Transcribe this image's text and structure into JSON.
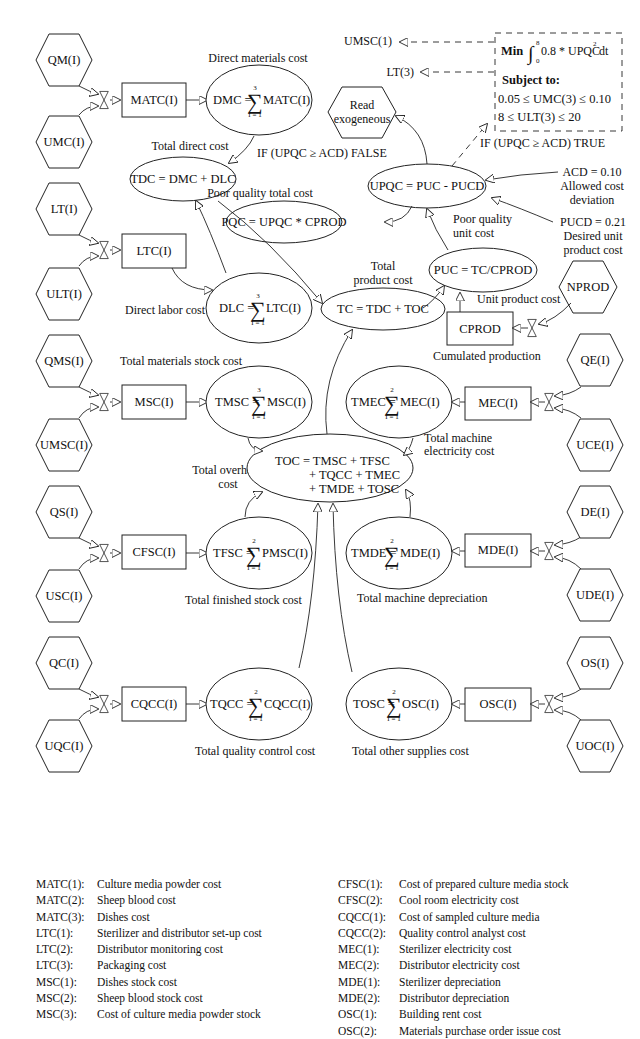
{
  "diagram": {
    "exogenous_left": [
      "QM(I)",
      "UMC(I)",
      "LT(I)",
      "ULT(I)",
      "QMS(I)",
      "UMSC(I)",
      "QS(I)",
      "USC(I)",
      "QC(I)",
      "UQC(I)"
    ],
    "exogenous_right": [
      "NPROD",
      "QE(I)",
      "UCE(I)",
      "DE(I)",
      "UDE(I)",
      "OS(I)",
      "UOC(I)"
    ],
    "read_exogeneous": [
      "Read",
      "exogeneous"
    ],
    "stocks": {
      "matc": "MATC(I)",
      "ltc": "LTC(I)",
      "msc": "MSC(I)",
      "cfsc": "CFSC(I)",
      "cqcc": "CQCC(I)",
      "cprod": "CPROD",
      "mec": "MEC(I)",
      "mde": "MDE(I)",
      "osc": "OSC(I)"
    },
    "sums": {
      "dmc": {
        "lhs": "DMC =",
        "rhs": "MATC(I)",
        "upper": "3",
        "lower": "I = 1",
        "caption": "Direct materials cost"
      },
      "dlc": {
        "lhs": "DLC =",
        "rhs": "LTC(I)",
        "upper": "3",
        "lower": "I = 1",
        "caption": "Direct labor cost"
      },
      "tmsc": {
        "lhs": "TMSC =",
        "rhs": "MSC(I)",
        "upper": "3",
        "lower": "I = 1",
        "caption": "Total materials stock cost"
      },
      "tfsc": {
        "lhs": "TFSC =",
        "rhs": "PMSC(I)",
        "upper": "2",
        "lower": "I = 1",
        "caption": "Total finished stock cost"
      },
      "tqcc": {
        "lhs": "TQCC =",
        "rhs": "CQCC(I)",
        "upper": "2",
        "lower": "I = 1",
        "caption": "Total quality control cost"
      },
      "tmec": {
        "lhs": "TMEC =",
        "rhs": "MEC(I)",
        "upper": "2",
        "lower": "I = 1",
        "caption": [
          "Total machine",
          "electricity cost"
        ]
      },
      "tmde": {
        "lhs": "TMDE =",
        "rhs": "MDE(I)",
        "upper": "2",
        "lower": "I = 1",
        "caption": "Total machine depreciation"
      },
      "tosc": {
        "lhs": "TOSC =",
        "rhs": "OSC(I)",
        "upper": "2",
        "lower": "I = 1",
        "caption": "Total other supplies cost"
      }
    },
    "equations": {
      "tdc": {
        "text": "TDC = DMC + DLC",
        "caption": "Total direct cost"
      },
      "tc": {
        "text": "TC = TDC + TOC",
        "caption": [
          "Total",
          "product cost"
        ]
      },
      "puc": {
        "text": "PUC = TC/CPROD",
        "caption": "Unit product cost"
      },
      "upqc": {
        "text": "UPQC = PUC - PUCD",
        "caption": [
          "Poor quality",
          "unit cost"
        ]
      },
      "pqc": {
        "text": "PQC = UPQC * CPROD",
        "caption": "Poor quality total cost"
      },
      "toc": {
        "lines": [
          "TOC = TMSC + TFSC",
          "+ TQCC + TMEC",
          "+ TMDE + TOSC"
        ],
        "caption": [
          "Total overhead",
          "cost"
        ]
      }
    },
    "cprod_caption": "Cumulated production",
    "constants": {
      "acd": [
        "ACD = 0.10",
        "Allowed cost",
        "deviation"
      ],
      "pucd": [
        "PUCD = 0.21",
        "Desired unit",
        "product cost"
      ]
    },
    "conditions": {
      "false_branch": "IF (UPQC ≥ ACD) FALSE",
      "true_branch": "IF (UPQC ≥ ACD) TRUE"
    },
    "optimization": {
      "objective_min": "Min",
      "integral_upper": "8",
      "integral_lower": "0",
      "objective_expr": "0.8 * UPQC",
      "objective_exp": "2",
      "objective_dt": "dt",
      "subject_to": "Subject to:",
      "constraints": [
        "0.05 ≤ UMC(3) ≤ 0.10",
        "8 ≤ ULT(3) ≤ 20"
      ],
      "outputs": [
        "UMSC(1)",
        "LT(3)"
      ]
    },
    "sigma": "∑"
  },
  "legend": {
    "left": [
      {
        "key": "MATC(1):",
        "desc": "Culture media powder cost"
      },
      {
        "key": "MATC(2):",
        "desc": "Sheep blood cost"
      },
      {
        "key": "MATC(3):",
        "desc": "Dishes cost"
      },
      {
        "key": "LTC(1):",
        "desc": "Sterilizer and distributor set-up cost"
      },
      {
        "key": "LTC(2):",
        "desc": "Distributor monitoring cost"
      },
      {
        "key": "LTC(3):",
        "desc": "Packaging cost"
      },
      {
        "key": "MSC(1):",
        "desc": "Dishes stock cost"
      },
      {
        "key": "MSC(2):",
        "desc": "Sheep blood stock cost"
      },
      {
        "key": "MSC(3):",
        "desc": "Cost of culture media powder stock"
      }
    ],
    "right": [
      {
        "key": "CFSC(1):",
        "desc": "Cost of prepared culture media stock"
      },
      {
        "key": "CFSC(2):",
        "desc": "Cool room electricity cost"
      },
      {
        "key": "CQCC(1):",
        "desc": "Cost of sampled culture media"
      },
      {
        "key": "CQCC(2):",
        "desc": "Quality control analyst cost"
      },
      {
        "key": "MEC(1):",
        "desc": "Sterilizer electricity cost"
      },
      {
        "key": "MEC(2):",
        "desc": "Distributor electricity cost"
      },
      {
        "key": "MDE(1):",
        "desc": "Sterilizer depreciation"
      },
      {
        "key": "MDE(2):",
        "desc": "Distributor depreciation"
      },
      {
        "key": "OSC(1):",
        "desc": "Building rent cost"
      },
      {
        "key": "OSC(2):",
        "desc": "Materials purchase order issue cost"
      }
    ]
  }
}
